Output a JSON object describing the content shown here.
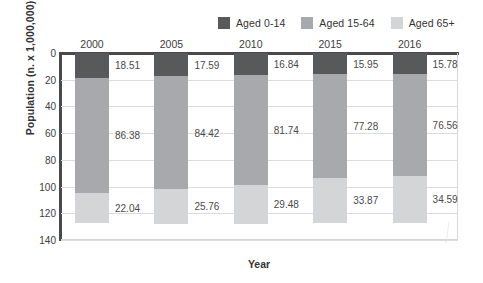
{
  "chart_data": {
    "type": "bar",
    "subtype": "stacked-horizontal-columns-inverted-y",
    "title": "",
    "xlabel": "Year",
    "ylabel": "Population (n. x 1,000,000)",
    "categories": [
      "2000",
      "2005",
      "2010",
      "2015",
      "2016"
    ],
    "series": [
      {
        "name": "Aged 0-14",
        "color": "#58595b",
        "values": [
          18.51,
          17.59,
          16.84,
          15.95,
          15.78
        ]
      },
      {
        "name": "Aged 15-64",
        "color": "#a7a9ac",
        "values": [
          86.38,
          84.42,
          81.74,
          77.28,
          76.56
        ]
      },
      {
        "name": "Aged 65+",
        "color": "#d4d5d7",
        "values": [
          22.04,
          25.76,
          29.48,
          33.87,
          34.59
        ]
      }
    ],
    "ylim": [
      0,
      140
    ],
    "y_inverted": true,
    "yticks": [
      0,
      20,
      40,
      60,
      80,
      100,
      120,
      140
    ],
    "grid": true,
    "legend_position": "top-right",
    "data_labels": true
  },
  "legend": {
    "items": [
      {
        "label": "Aged 0-14",
        "swatch": "legend-swatch-aged-0-14",
        "color": "#58595b"
      },
      {
        "label": "Aged 15-64",
        "swatch": "legend-swatch-aged-15-64",
        "color": "#a7a9ac"
      },
      {
        "label": "Aged 65+",
        "swatch": "legend-swatch-aged-65",
        "color": "#d4d5d7"
      }
    ]
  }
}
